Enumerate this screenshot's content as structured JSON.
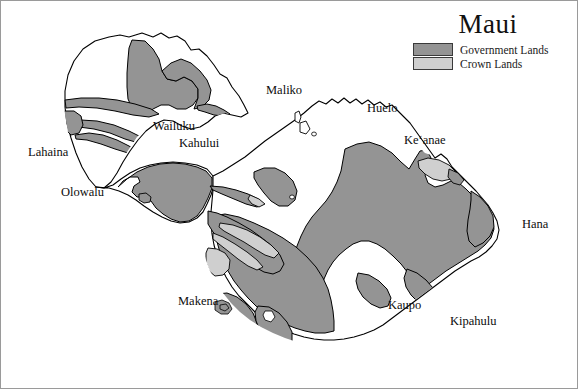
{
  "map": {
    "title": "Maui",
    "background_color": "#ffffff",
    "outline_color": "#000000",
    "frame_color": "#9a9a9a",
    "legend": {
      "items": [
        {
          "label": "Government Lands",
          "color": "#949494",
          "swatch_name": "government-lands-swatch"
        },
        {
          "label": "Crown Lands",
          "color": "#cfcfcf",
          "swatch_name": "crown-lands-swatch"
        }
      ]
    },
    "places": [
      {
        "name": "Lahaina",
        "label": "Lahaina",
        "x": 27,
        "y": 144
      },
      {
        "name": "Olowalu",
        "label": "Olowalu",
        "x": 60,
        "y": 184
      },
      {
        "name": "Wailuku",
        "label": "Wailuku",
        "x": 152,
        "y": 118
      },
      {
        "name": "Kahului",
        "label": "Kahului",
        "x": 178,
        "y": 135
      },
      {
        "name": "Maliko",
        "label": "Maliko",
        "x": 265,
        "y": 82
      },
      {
        "name": "Huelo",
        "label": "Huelo",
        "x": 366,
        "y": 100
      },
      {
        "name": "Keanae",
        "label": "Keʻanae",
        "x": 403,
        "y": 132
      },
      {
        "name": "Hana",
        "label": "Hana",
        "x": 521,
        "y": 216
      },
      {
        "name": "Kipahulu",
        "label": "Kipahulu",
        "x": 449,
        "y": 313
      },
      {
        "name": "Kaupo",
        "label": "Kaupo",
        "x": 387,
        "y": 297
      },
      {
        "name": "Makena",
        "label": "Makena",
        "x": 177,
        "y": 293
      }
    ]
  }
}
